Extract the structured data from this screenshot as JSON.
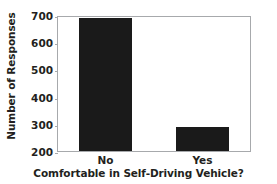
{
  "chart_data": {
    "type": "bar",
    "title": "",
    "categories": [
      "No",
      "Yes"
    ],
    "values": [
      688,
      289
    ],
    "series": [
      {
        "name": "Number of Responses",
        "values": [
          688,
          289
        ]
      }
    ],
    "xlabel": "Comfortable in Self-Driving Vehicle?",
    "ylabel": "Number of Responses",
    "ylim": [
      200,
      700
    ],
    "yticks": [
      200,
      300,
      400,
      500,
      600,
      700
    ],
    "ytick_labels": [
      "200",
      "300",
      "400",
      "500",
      "600",
      "700"
    ],
    "xticks": [
      "No",
      "Yes"
    ],
    "grid": false,
    "legend": false,
    "legend_position": "none",
    "bar_color": "#1a1a1a",
    "frame_color": "#a7a9ac",
    "text_color": "#231f20",
    "background": "#ffffff"
  }
}
